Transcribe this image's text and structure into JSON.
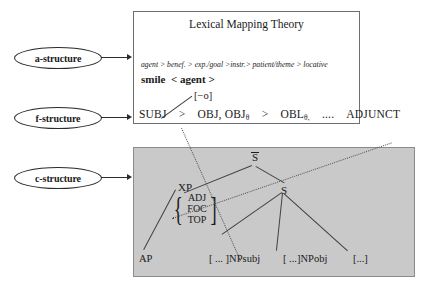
{
  "figure": {
    "title": "Lexical Mapping Theory"
  },
  "levels": [
    {
      "id": "a-structure",
      "label": "a-structure"
    },
    {
      "id": "f-structure",
      "label": "f-structure"
    },
    {
      "id": "c-structure",
      "label": "c-structure"
    }
  ],
  "lmt": {
    "title": "Lexical Mapping Theory",
    "thematic_hierarchy": "agent > benef. > exp./goal >instr.> patient/theme > locative",
    "predicate": "smile",
    "argument_list": "< agent >",
    "feature": "[−o]"
  },
  "gf_hierarchy": {
    "items": [
      {
        "label": "SUBJ",
        "subscript": ""
      },
      {
        "label": "OBJ, OBJ",
        "subscript": "θ"
      },
      {
        "label": "OBL",
        "subscript": "θ,"
      },
      {
        "label": "....",
        "subscript": ""
      },
      {
        "label": "ADJUNCT",
        "subscript": ""
      }
    ],
    "separator": ">"
  },
  "tree": {
    "nodes": [
      {
        "id": "sbar",
        "label": "S",
        "overbar": true
      },
      {
        "id": "s",
        "label": "S"
      },
      {
        "id": "xp",
        "label": "XP"
      }
    ],
    "set": {
      "open": "{",
      "close": "]",
      "items": [
        "ADJ",
        "FOC",
        "TOP"
      ]
    },
    "leaves": [
      {
        "id": "ap",
        "label": "AP"
      },
      {
        "id": "npsubj",
        "label": "[ ... ]NPsubj"
      },
      {
        "id": "npobj",
        "label": "[ ...]NPobj"
      },
      {
        "id": "etc",
        "label": "[...]"
      }
    ]
  },
  "colors": {
    "c_structure_background": "#c9c9c9",
    "box_border": "#6e6e6e",
    "line": "#404040",
    "text": "#1a1a1a"
  }
}
